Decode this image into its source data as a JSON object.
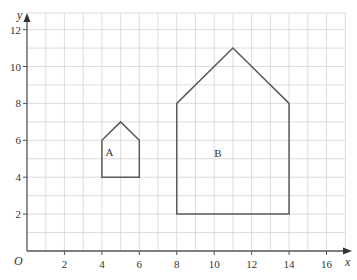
{
  "axes": {
    "x_label": "x",
    "y_label": "y",
    "origin_label": "O",
    "x_ticks": [
      "2",
      "4",
      "6",
      "8",
      "10",
      "12",
      "14",
      "16"
    ],
    "y_ticks": [
      "2",
      "4",
      "6",
      "8",
      "10",
      "12"
    ],
    "x_range": [
      0,
      17
    ],
    "y_range": [
      0,
      13
    ]
  },
  "shapes": [
    {
      "label": "A",
      "vertices": [
        [
          4,
          4
        ],
        [
          6,
          4
        ],
        [
          6,
          6
        ],
        [
          5,
          7
        ],
        [
          4,
          6
        ]
      ]
    },
    {
      "label": "B",
      "vertices": [
        [
          8,
          2
        ],
        [
          14,
          2
        ],
        [
          14,
          8
        ],
        [
          11,
          11
        ],
        [
          8,
          8
        ]
      ]
    }
  ],
  "colors": {
    "grid": "#d4d4d4",
    "axis": "#555555",
    "shape": "#5a5a5a"
  }
}
